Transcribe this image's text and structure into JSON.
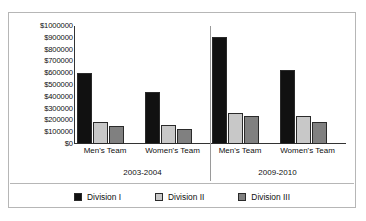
{
  "chart_data": {
    "type": "bar",
    "title": "",
    "subtitle": "",
    "xlabel": "",
    "ylabel": "",
    "grid": false,
    "legend_position": "bottom",
    "ylim": [
      0,
      1000000
    ],
    "ytick_labels": [
      "$1000000",
      "$900000",
      "$800000",
      "$700000",
      "$600000",
      "$500000",
      "$400000",
      "$300000",
      "$200000",
      "$100000",
      "$0"
    ],
    "ytick_values": [
      1000000,
      900000,
      800000,
      700000,
      600000,
      500000,
      400000,
      300000,
      200000,
      100000,
      0
    ],
    "categories": [
      "Men's Team",
      "Women's Team",
      "Men's Team",
      "Women's Team"
    ],
    "group_labels": [
      "2003-2004",
      "2009-2010"
    ],
    "series": [
      {
        "name": "Division I",
        "color": "#111111",
        "values": [
          600000,
          440000,
          905000,
          630000
        ]
      },
      {
        "name": "Division II",
        "color": "#c8c8c8",
        "values": [
          185000,
          165000,
          260000,
          235000
        ]
      },
      {
        "name": "Division III",
        "color": "#808080",
        "values": [
          150000,
          125000,
          235000,
          190000
        ]
      }
    ]
  },
  "legend": {
    "items": [
      {
        "label": "Division I",
        "color": "#111111"
      },
      {
        "label": "Division II",
        "color": "#c8c8c8"
      },
      {
        "label": "Division III",
        "color": "#808080"
      }
    ]
  }
}
